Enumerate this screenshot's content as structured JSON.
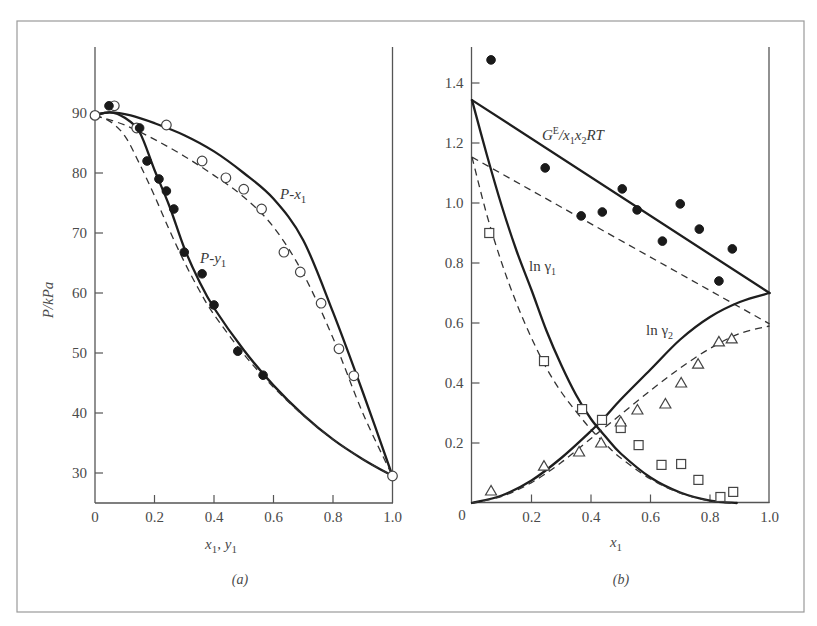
{
  "figure": {
    "caption_a": "(a)",
    "caption_b": "(b)"
  },
  "chart_data": [
    {
      "id": "a",
      "type": "scatter",
      "title": "",
      "xlabel": "x1, y1",
      "ylabel": "P/kPa",
      "xlim": [
        0,
        1.0
      ],
      "ylim": [
        25,
        100
      ],
      "xticks": [
        "0",
        "0.2",
        "0.4",
        "0.6",
        "0.8",
        "1.0"
      ],
      "yticks": [
        "30",
        "40",
        "50",
        "60",
        "70",
        "80",
        "90"
      ],
      "grid": false,
      "annotations": [
        "P-x1",
        "P-y1"
      ],
      "series": [
        {
          "name": "P-x1 data (open circles)",
          "marker": "open-circle",
          "x": [
            0.0,
            0.065,
            0.14,
            0.24,
            0.36,
            0.44,
            0.5,
            0.56,
            0.635,
            0.69,
            0.76,
            0.82,
            0.87,
            1.0
          ],
          "y": [
            89.6,
            91.2,
            87.5,
            88.0,
            82.0,
            79.2,
            77.3,
            74.0,
            66.8,
            63.5,
            58.3,
            50.7,
            46.2,
            29.5
          ]
        },
        {
          "name": "P-y1 data (filled circles)",
          "marker": "filled-circle",
          "x": [
            0.047,
            0.15,
            0.175,
            0.215,
            0.24,
            0.265,
            0.3,
            0.36,
            0.4,
            0.48,
            0.565
          ],
          "y": [
            91.2,
            87.5,
            82.0,
            79.0,
            77.0,
            74.0,
            66.8,
            63.2,
            58.0,
            50.3,
            46.3
          ]
        },
        {
          "name": "P-x1 fit (solid)",
          "style": "solid",
          "x": [
            0.0,
            0.05,
            0.12,
            0.2,
            0.3,
            0.4,
            0.5,
            0.6,
            0.7,
            0.8,
            0.9,
            1.0
          ],
          "y": [
            89.6,
            90.1,
            89.6,
            88.3,
            86.3,
            83.6,
            80.0,
            75.7,
            68.8,
            56.8,
            43.5,
            29.5
          ]
        },
        {
          "name": "P-x1 fit (dashed)",
          "style": "dashed",
          "x": [
            0.0,
            0.1,
            0.2,
            0.3,
            0.4,
            0.5,
            0.6,
            0.7,
            0.8,
            0.9,
            1.0
          ],
          "y": [
            89.6,
            88.0,
            85.6,
            82.8,
            79.6,
            76.0,
            71.0,
            63.2,
            52.5,
            40.0,
            29.5
          ]
        },
        {
          "name": "P-y1 fit (solid)",
          "style": "solid",
          "x": [
            0.0,
            0.05,
            0.1,
            0.15,
            0.2,
            0.25,
            0.3,
            0.35,
            0.4,
            0.5,
            0.6,
            0.7,
            0.8,
            0.9,
            1.0
          ],
          "y": [
            89.6,
            90.1,
            89.2,
            86.8,
            80.5,
            74.5,
            67.5,
            62.0,
            57.5,
            50.5,
            44.6,
            39.7,
            35.6,
            32.3,
            29.5
          ]
        },
        {
          "name": "P-y1 fit (dashed)",
          "style": "dashed",
          "x": [
            0.0,
            0.05,
            0.1,
            0.15,
            0.2,
            0.25,
            0.3,
            0.35,
            0.4,
            0.5,
            0.6,
            0.7,
            0.8,
            0.9,
            1.0
          ],
          "y": [
            89.6,
            88.6,
            86.2,
            81.5,
            76.2,
            70.5,
            65.2,
            60.5,
            56.4,
            49.8,
            44.3,
            39.6,
            35.6,
            32.3,
            29.5
          ]
        }
      ]
    },
    {
      "id": "b",
      "type": "scatter",
      "title": "",
      "xlabel": "x1",
      "ylabel": "",
      "xlim": [
        0,
        1.0
      ],
      "ylim": [
        0,
        1.52
      ],
      "xticks": [
        "0",
        "0.2",
        "0.4",
        "0.6",
        "0.8",
        "1.0"
      ],
      "yticks": [
        "0.2",
        "0.4",
        "0.6",
        "0.8",
        "1.0",
        "1.2",
        "1.4"
      ],
      "origin_label": "0",
      "grid": false,
      "annotations": [
        "GE/x1x2RT",
        "ln γ1",
        "ln γ2"
      ],
      "series": [
        {
          "name": "GE/x1x2RT data (filled circles)",
          "marker": "filled-circle",
          "x": [
            0.064,
            0.246,
            0.367,
            0.438,
            0.505,
            0.555,
            0.64,
            0.7,
            0.764,
            0.83,
            0.875
          ],
          "y": [
            1.477,
            1.117,
            0.957,
            0.97,
            1.047,
            0.977,
            0.873,
            0.997,
            0.913,
            0.74,
            0.847
          ]
        },
        {
          "name": "ln γ1 data (open squares)",
          "marker": "open-square",
          "x": [
            0.058,
            0.242,
            0.37,
            0.437,
            0.5,
            0.56,
            0.637,
            0.703,
            0.761,
            0.835,
            0.878
          ],
          "y": [
            0.9,
            0.473,
            0.313,
            0.277,
            0.25,
            0.193,
            0.127,
            0.13,
            0.077,
            0.02,
            0.037
          ]
        },
        {
          "name": "ln γ2 data (open triangles)",
          "marker": "open-triangle",
          "x": [
            0.064,
            0.242,
            0.36,
            0.434,
            0.5,
            0.556,
            0.65,
            0.703,
            0.76,
            0.83,
            0.873
          ],
          "y": [
            0.04,
            0.123,
            0.17,
            0.2,
            0.27,
            0.31,
            0.33,
            0.4,
            0.463,
            0.537,
            0.547
          ]
        },
        {
          "name": "GE/x1x2RT fit (solid)",
          "style": "solid",
          "x": [
            0.0,
            1.0
          ],
          "y": [
            1.343,
            0.7
          ]
        },
        {
          "name": "GE/x1x2RT fit (dashed)",
          "style": "dashed",
          "x": [
            0.0,
            1.0
          ],
          "y": [
            1.153,
            0.597
          ]
        },
        {
          "name": "ln γ1 fit (solid)",
          "style": "solid",
          "x": [
            0.0,
            0.05,
            0.1,
            0.15,
            0.2,
            0.25,
            0.3,
            0.35,
            0.4,
            0.45,
            0.5,
            0.6,
            0.7,
            0.8,
            0.89
          ],
          "y": [
            1.343,
            1.16,
            0.99,
            0.84,
            0.71,
            0.575,
            0.46,
            0.36,
            0.28,
            0.22,
            0.165,
            0.085,
            0.035,
            0.008,
            0.0
          ]
        },
        {
          "name": "ln γ1 fit (dashed)",
          "style": "dashed",
          "x": [
            0.0,
            0.05,
            0.1,
            0.15,
            0.2,
            0.25,
            0.3,
            0.35,
            0.4,
            0.45,
            0.5,
            0.6,
            0.7,
            0.8,
            0.87
          ],
          "y": [
            1.153,
            0.96,
            0.8,
            0.665,
            0.55,
            0.45,
            0.37,
            0.305,
            0.245,
            0.195,
            0.15,
            0.08,
            0.033,
            0.007,
            0.0
          ]
        },
        {
          "name": "ln γ2 fit (solid)",
          "style": "solid",
          "x": [
            0.0,
            0.1,
            0.2,
            0.3,
            0.4,
            0.45,
            0.5,
            0.6,
            0.7,
            0.8,
            0.9,
            1.0
          ],
          "y": [
            0.0,
            0.025,
            0.075,
            0.15,
            0.24,
            0.29,
            0.345,
            0.445,
            0.545,
            0.62,
            0.67,
            0.7
          ]
        },
        {
          "name": "ln γ2 fit (dashed)",
          "style": "dashed",
          "x": [
            0.0,
            0.1,
            0.2,
            0.3,
            0.4,
            0.45,
            0.5,
            0.6,
            0.7,
            0.8,
            0.9,
            1.0
          ],
          "y": [
            0.0,
            0.022,
            0.068,
            0.135,
            0.215,
            0.255,
            0.295,
            0.375,
            0.45,
            0.515,
            0.565,
            0.59
          ]
        }
      ]
    }
  ],
  "labels": {
    "a_ylabel": "P/kPa",
    "a_xlabel_x": "x",
    "a_xlabel_sep": ", ",
    "a_xlabel_y": "y",
    "a_sub": "1",
    "a_px1_P": "P-",
    "a_px1_x": "x",
    "a_py1_P": "P-",
    "a_py1_y": "y",
    "b_xlabel": "x",
    "b_sub": "1",
    "b_ge_G": "G",
    "b_ge_E": "E",
    "b_ge_rest1": "/x",
    "b_ge_1": "1",
    "b_ge_x": "x",
    "b_ge_2": "2",
    "b_ge_RT": "RT",
    "b_lng1": "ln γ",
    "b_lng2": "ln γ",
    "b_g_sub1": "1",
    "b_g_sub2": "2",
    "origin0": "0"
  }
}
